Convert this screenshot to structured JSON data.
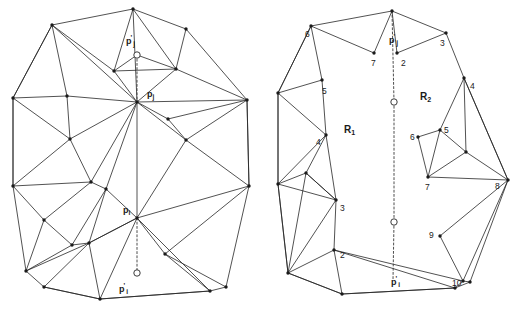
{
  "figure": {
    "stroke_color": "#262626",
    "vertex_color": "#1a1a1a",
    "background": "#ffffff"
  },
  "left_panel": {
    "name": "original-triangulation",
    "labels": [
      {
        "id": "pj-prime",
        "text": "p",
        "prime": "'",
        "sub": "j",
        "x": 126,
        "y": 37
      },
      {
        "id": "pj",
        "text": "p",
        "prime": "",
        "sub": "j",
        "x": 147,
        "y": 90
      },
      {
        "id": "pi",
        "text": "p",
        "prime": "",
        "sub": "i",
        "x": 123,
        "y": 206
      },
      {
        "id": "pi-prime",
        "text": "p",
        "prime": "'",
        "sub": "i",
        "x": 119,
        "y": 285
      }
    ],
    "open_nodes": [
      {
        "id": "open-node-pj-prime",
        "x": 137,
        "y": 55
      },
      {
        "id": "open-node-pi-prime",
        "x": 137,
        "y": 273
      }
    ],
    "hub_nodes": [
      {
        "id": "hub-pj",
        "x": 137,
        "y": 102
      },
      {
        "id": "hub-pi",
        "x": 137,
        "y": 218
      }
    ],
    "outline": [
      [
        133,
        9
      ],
      [
        52,
        25
      ],
      [
        13,
        98
      ],
      [
        13,
        186
      ],
      [
        26,
        271
      ],
      [
        44,
        287
      ],
      [
        100,
        299
      ],
      [
        210,
        291
      ],
      [
        226,
        287
      ],
      [
        249,
        186
      ],
      [
        247,
        100
      ],
      [
        186,
        29
      ]
    ],
    "interior_points": [
      [
        137,
        102
      ],
      [
        137,
        218
      ],
      [
        67,
        96
      ],
      [
        70,
        139
      ],
      [
        91,
        182
      ],
      [
        44,
        220
      ],
      [
        89,
        243
      ],
      [
        72,
        245
      ],
      [
        168,
        119
      ],
      [
        186,
        140
      ],
      [
        106,
        189
      ],
      [
        165,
        254
      ],
      [
        114,
        71
      ],
      [
        176,
        69
      ]
    ],
    "edges": [
      [
        [
          133,
          9
        ],
        [
          52,
          25
        ]
      ],
      [
        [
          52,
          25
        ],
        [
          13,
          98
        ]
      ],
      [
        [
          13,
          98
        ],
        [
          13,
          186
        ]
      ],
      [
        [
          13,
          186
        ],
        [
          26,
          271
        ]
      ],
      [
        [
          26,
          271
        ],
        [
          44,
          287
        ]
      ],
      [
        [
          44,
          287
        ],
        [
          100,
          299
        ]
      ],
      [
        [
          100,
          299
        ],
        [
          210,
          291
        ]
      ],
      [
        [
          210,
          291
        ],
        [
          226,
          287
        ]
      ],
      [
        [
          226,
          287
        ],
        [
          249,
          186
        ]
      ],
      [
        [
          249,
          186
        ],
        [
          247,
          100
        ]
      ],
      [
        [
          247,
          100
        ],
        [
          186,
          29
        ]
      ],
      [
        [
          186,
          29
        ],
        [
          133,
          9
        ]
      ],
      [
        [
          133,
          9
        ],
        [
          114,
          71
        ]
      ],
      [
        [
          133,
          9
        ],
        [
          137,
          102
        ]
      ],
      [
        [
          133,
          9
        ],
        [
          176,
          69
        ]
      ],
      [
        [
          114,
          71
        ],
        [
          176,
          69
        ]
      ],
      [
        [
          114,
          71
        ],
        [
          137,
          102
        ]
      ],
      [
        [
          176,
          69
        ],
        [
          137,
          102
        ]
      ],
      [
        [
          176,
          69
        ],
        [
          186,
          29
        ]
      ],
      [
        [
          176,
          69
        ],
        [
          247,
          100
        ]
      ],
      [
        [
          52,
          25
        ],
        [
          114,
          71
        ]
      ],
      [
        [
          52,
          25
        ],
        [
          67,
          96
        ]
      ],
      [
        [
          52,
          25
        ],
        [
          137,
          102
        ]
      ],
      [
        [
          52,
          25
        ],
        [
          13,
          98
        ]
      ],
      [
        [
          67,
          96
        ],
        [
          137,
          102
        ]
      ],
      [
        [
          67,
          96
        ],
        [
          13,
          98
        ]
      ],
      [
        [
          67,
          96
        ],
        [
          70,
          139
        ]
      ],
      [
        [
          70,
          139
        ],
        [
          13,
          98
        ]
      ],
      [
        [
          70,
          139
        ],
        [
          137,
          102
        ]
      ],
      [
        [
          70,
          139
        ],
        [
          91,
          182
        ]
      ],
      [
        [
          70,
          139
        ],
        [
          13,
          186
        ]
      ],
      [
        [
          13,
          98
        ],
        [
          13,
          186
        ]
      ],
      [
        [
          91,
          182
        ],
        [
          13,
          186
        ]
      ],
      [
        [
          91,
          182
        ],
        [
          137,
          102
        ]
      ],
      [
        [
          91,
          182
        ],
        [
          44,
          220
        ]
      ],
      [
        [
          91,
          182
        ],
        [
          106,
          189
        ]
      ],
      [
        [
          44,
          220
        ],
        [
          13,
          186
        ]
      ],
      [
        [
          44,
          220
        ],
        [
          26,
          271
        ]
      ],
      [
        [
          44,
          220
        ],
        [
          72,
          245
        ]
      ],
      [
        [
          72,
          245
        ],
        [
          26,
          271
        ]
      ],
      [
        [
          72,
          245
        ],
        [
          106,
          189
        ]
      ],
      [
        [
          72,
          245
        ],
        [
          89,
          243
        ]
      ],
      [
        [
          89,
          243
        ],
        [
          44,
          287
        ]
      ],
      [
        [
          89,
          243
        ],
        [
          26,
          271
        ]
      ],
      [
        [
          89,
          243
        ],
        [
          106,
          189
        ]
      ],
      [
        [
          89,
          243
        ],
        [
          137,
          218
        ]
      ],
      [
        [
          106,
          189
        ],
        [
          137,
          218
        ]
      ],
      [
        [
          106,
          189
        ],
        [
          137,
          102
        ]
      ],
      [
        [
          137,
          102
        ],
        [
          137,
          218
        ]
      ],
      [
        [
          137,
          102
        ],
        [
          168,
          119
        ]
      ],
      [
        [
          137,
          102
        ],
        [
          186,
          140
        ]
      ],
      [
        [
          137,
          102
        ],
        [
          247,
          100
        ]
      ],
      [
        [
          168,
          119
        ],
        [
          186,
          140
        ]
      ],
      [
        [
          168,
          119
        ],
        [
          247,
          100
        ]
      ],
      [
        [
          186,
          140
        ],
        [
          247,
          100
        ]
      ],
      [
        [
          186,
          140
        ],
        [
          137,
          218
        ]
      ],
      [
        [
          186,
          140
        ],
        [
          249,
          186
        ]
      ],
      [
        [
          247,
          100
        ],
        [
          249,
          186
        ]
      ],
      [
        [
          137,
          218
        ],
        [
          249,
          186
        ]
      ],
      [
        [
          137,
          218
        ],
        [
          165,
          254
        ]
      ],
      [
        [
          137,
          218
        ],
        [
          89,
          243
        ]
      ],
      [
        [
          165,
          254
        ],
        [
          249,
          186
        ]
      ],
      [
        [
          165,
          254
        ],
        [
          226,
          287
        ]
      ],
      [
        [
          165,
          254
        ],
        [
          210,
          291
        ]
      ],
      [
        [
          89,
          243
        ],
        [
          100,
          299
        ]
      ],
      [
        [
          44,
          287
        ],
        [
          100,
          299
        ]
      ],
      [
        [
          100,
          299
        ],
        [
          210,
          291
        ]
      ],
      [
        [
          137,
          218
        ],
        [
          100,
          299
        ]
      ],
      [
        [
          137,
          218
        ],
        [
          210,
          291
        ]
      ],
      [
        [
          114,
          71
        ],
        [
          137,
          55
        ]
      ],
      [
        [
          137,
          55
        ],
        [
          176,
          69
        ]
      ]
    ],
    "dashed_segments": [
      [
        [
          137,
          55
        ],
        [
          137,
          102
        ]
      ],
      [
        [
          137,
          218
        ],
        [
          137,
          273
        ]
      ]
    ]
  },
  "right_panel": {
    "name": "split-regions",
    "regions": [
      {
        "id": "region-r1",
        "text": "R",
        "sub": "1",
        "x": 344,
        "y": 125
      },
      {
        "id": "region-r2",
        "text": "R",
        "sub": "2",
        "x": 420,
        "y": 92
      }
    ],
    "labels": [
      {
        "id": "pj-prime-right",
        "text": "p",
        "prime": "'",
        "sub": "j",
        "x": 389,
        "y": 36
      },
      {
        "id": "pi-prime-right",
        "text": "p",
        "prime": "'",
        "sub": "i",
        "x": 391,
        "y": 278
      }
    ],
    "open_nodes": [
      {
        "id": "open-node-upper",
        "x": 394,
        "y": 102
      },
      {
        "id": "open-node-lower",
        "x": 394,
        "y": 222
      }
    ],
    "vertex_numbers": [
      {
        "id": "v-6-left",
        "text": "6",
        "x": 305,
        "y": 30
      },
      {
        "id": "v-7-top",
        "text": "7",
        "x": 371,
        "y": 59
      },
      {
        "id": "v-2-top",
        "text": "2",
        "x": 401,
        "y": 59
      },
      {
        "id": "v-3-top",
        "text": "3",
        "x": 440,
        "y": 39
      },
      {
        "id": "v-5-left",
        "text": "5",
        "x": 322,
        "y": 87
      },
      {
        "id": "v-4-left",
        "text": "4",
        "x": 316,
        "y": 138
      },
      {
        "id": "v-3-left",
        "text": "3",
        "x": 340,
        "y": 204
      },
      {
        "id": "v-2-left",
        "text": "2",
        "x": 340,
        "y": 251
      },
      {
        "id": "v-4-right",
        "text": "4",
        "x": 470,
        "y": 82
      },
      {
        "id": "v-5-inner",
        "text": "5",
        "x": 444,
        "y": 126
      },
      {
        "id": "v-6-inner",
        "text": "6",
        "x": 410,
        "y": 133
      },
      {
        "id": "v-7-inner",
        "text": "7",
        "x": 425,
        "y": 183
      },
      {
        "id": "v-8-inner",
        "text": "8",
        "x": 495,
        "y": 182
      },
      {
        "id": "v-9",
        "text": "9",
        "x": 429,
        "y": 231
      },
      {
        "id": "v-10",
        "text": "10",
        "x": 452,
        "y": 279
      }
    ],
    "edges": [
      [
        [
          392,
          11
        ],
        [
          311,
          26
        ]
      ],
      [
        [
          311,
          26
        ],
        [
          278,
          93
        ]
      ],
      [
        [
          278,
          93
        ],
        [
          278,
          184
        ]
      ],
      [
        [
          278,
          184
        ],
        [
          288,
          273
        ]
      ],
      [
        [
          288,
          273
        ],
        [
          342,
          294
        ]
      ],
      [
        [
          342,
          294
        ],
        [
          455,
          288
        ]
      ],
      [
        [
          455,
          288
        ],
        [
          470,
          282
        ]
      ],
      [
        [
          470,
          282
        ],
        [
          508,
          180
        ]
      ],
      [
        [
          508,
          180
        ],
        [
          464,
          78
        ]
      ],
      [
        [
          464,
          78
        ],
        [
          446,
          33
        ]
      ],
      [
        [
          446,
          33
        ],
        [
          392,
          11
        ]
      ],
      [
        [
          392,
          11
        ],
        [
          374,
          53
        ]
      ],
      [
        [
          374,
          53
        ],
        [
          311,
          26
        ]
      ],
      [
        [
          392,
          11
        ],
        [
          397,
          53
        ]
      ],
      [
        [
          397,
          53
        ],
        [
          446,
          33
        ]
      ],
      [
        [
          311,
          26
        ],
        [
          322,
          80
        ]
      ],
      [
        [
          311,
          26
        ],
        [
          278,
          93
        ]
      ],
      [
        [
          322,
          80
        ],
        [
          278,
          93
        ]
      ],
      [
        [
          322,
          80
        ],
        [
          326,
          135
        ]
      ],
      [
        [
          326,
          135
        ],
        [
          278,
          93
        ]
      ],
      [
        [
          326,
          135
        ],
        [
          278,
          184
        ]
      ],
      [
        [
          326,
          135
        ],
        [
          306,
          173
        ]
      ],
      [
        [
          278,
          93
        ],
        [
          278,
          184
        ]
      ],
      [
        [
          306,
          173
        ],
        [
          278,
          184
        ]
      ],
      [
        [
          306,
          173
        ],
        [
          336,
          200
        ]
      ],
      [
        [
          326,
          135
        ],
        [
          336,
          200
        ]
      ],
      [
        [
          336,
          200
        ],
        [
          278,
          184
        ]
      ],
      [
        [
          336,
          200
        ],
        [
          306,
          173
        ]
      ],
      [
        [
          278,
          184
        ],
        [
          288,
          273
        ]
      ],
      [
        [
          306,
          173
        ],
        [
          288,
          273
        ]
      ],
      [
        [
          336,
          200
        ],
        [
          288,
          273
        ]
      ],
      [
        [
          336,
          200
        ],
        [
          334,
          250
        ]
      ],
      [
        [
          334,
          250
        ],
        [
          288,
          273
        ]
      ],
      [
        [
          334,
          250
        ],
        [
          342,
          294
        ]
      ],
      [
        [
          334,
          250
        ],
        [
          455,
          288
        ]
      ],
      [
        [
          288,
          273
        ],
        [
          342,
          294
        ]
      ],
      [
        [
          342,
          294
        ],
        [
          455,
          288
        ]
      ],
      [
        [
          464,
          78
        ],
        [
          440,
          130
        ]
      ],
      [
        [
          464,
          78
        ],
        [
          466,
          152
        ]
      ],
      [
        [
          464,
          78
        ],
        [
          508,
          180
        ]
      ],
      [
        [
          440,
          130
        ],
        [
          418,
          137
        ]
      ],
      [
        [
          440,
          130
        ],
        [
          466,
          152
        ]
      ],
      [
        [
          440,
          130
        ],
        [
          428,
          177
        ]
      ],
      [
        [
          418,
          137
        ],
        [
          428,
          177
        ]
      ],
      [
        [
          428,
          177
        ],
        [
          466,
          152
        ]
      ],
      [
        [
          428,
          177
        ],
        [
          508,
          180
        ]
      ],
      [
        [
          466,
          152
        ],
        [
          508,
          180
        ]
      ],
      [
        [
          508,
          180
        ],
        [
          440,
          236
        ]
      ],
      [
        [
          440,
          236
        ],
        [
          463,
          281
        ]
      ],
      [
        [
          463,
          281
        ],
        [
          508,
          180
        ]
      ],
      [
        [
          463,
          281
        ],
        [
          470,
          282
        ]
      ],
      [
        [
          463,
          281
        ],
        [
          455,
          288
        ]
      ],
      [
        [
          334,
          250
        ],
        [
          463,
          281
        ]
      ]
    ],
    "dashed_segments": [
      [
        [
          392,
          11
        ],
        [
          394,
          102
        ]
      ],
      [
        [
          394,
          102
        ],
        [
          394,
          222
        ]
      ],
      [
        [
          394,
          222
        ],
        [
          393,
          280
        ]
      ]
    ]
  }
}
